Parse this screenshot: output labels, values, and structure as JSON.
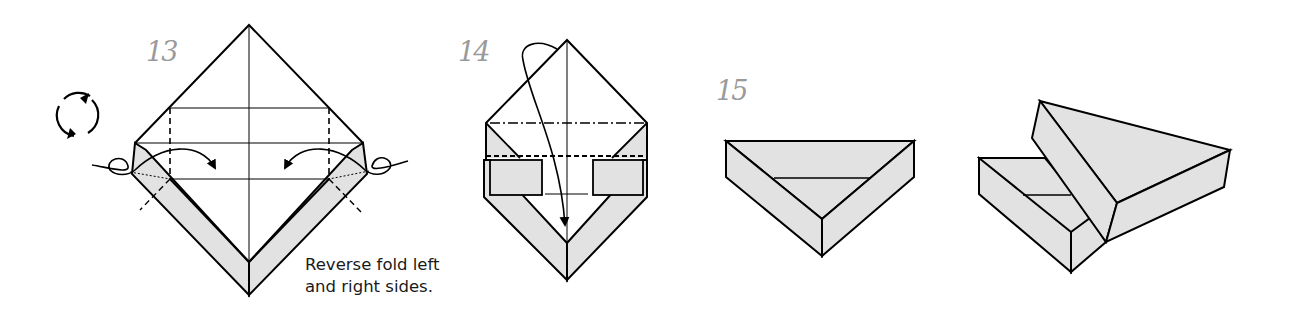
{
  "steps": [
    {
      "number": "13",
      "caption": [
        "Reverse fold left",
        "and right sides."
      ]
    },
    {
      "number": "14"
    },
    {
      "number": "15"
    }
  ],
  "icons": {
    "rotate": "rotate-model-icon"
  },
  "colors": {
    "paper_back": "#e2e2e2",
    "line": "#000000",
    "step_number": "#9a9a9a"
  }
}
